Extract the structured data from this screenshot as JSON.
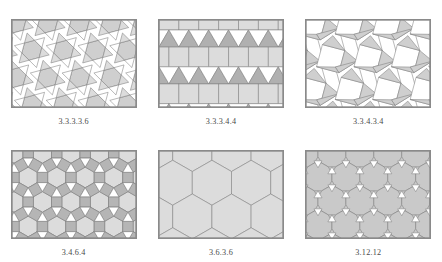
{
  "figure": {
    "kind": "plate-of-tilings",
    "background_color": "#ffffff",
    "panel_border_color": "#8a8a8a",
    "caption_color": "#4a4a4a",
    "colors": {
      "light_gray": "#dcdcdc",
      "mid_gray": "#c9c9c9",
      "dark_gray": "#b0b0b0",
      "white": "#ffffff",
      "stroke": "#7d7d7d"
    },
    "rows": 2,
    "columns": 3
  },
  "panels": [
    {
      "id": "snub-hexagonal",
      "caption": "3.3.3.3.6",
      "tiling": "snub hexagonal",
      "shapes": [
        "triangle",
        "hexagon"
      ],
      "fills": {
        "hexagon": "#cfcfcf",
        "triangle_a": "#dcdcdc",
        "triangle_b": "#ffffff"
      }
    },
    {
      "id": "elongated-triangular",
      "caption": "3.3.3.4.4",
      "tiling": "elongated triangular",
      "shapes": [
        "triangle",
        "square"
      ],
      "fills": {
        "square": "#dcdcdc",
        "triangle_up": "#b0b0b0",
        "triangle_down": "#ffffff"
      }
    },
    {
      "id": "snub-square",
      "caption": "3.3.4.3.4",
      "tiling": "snub square",
      "shapes": [
        "triangle",
        "square"
      ],
      "fills": {
        "square": "#ffffff",
        "triangle": "#cfcfcf"
      }
    },
    {
      "id": "rhombitrihexagonal",
      "caption": "3.4.6.4",
      "tiling": "rhombitrihexagonal",
      "shapes": [
        "triangle",
        "square",
        "hexagon"
      ],
      "fills": {
        "hexagon": "#dcdcdc",
        "square": "#b5b5b5",
        "triangle": "#ffffff"
      }
    },
    {
      "id": "trihexagonal",
      "caption": "3.6.3.6",
      "tiling": "trihexagonal",
      "shapes": [
        "triangle",
        "hexagon"
      ],
      "fills": {
        "hexagon": "#dcdcdc",
        "triangle": "#ffffff"
      }
    },
    {
      "id": "truncated-hexagonal",
      "caption": "3.12.12",
      "tiling": "truncated hexagonal",
      "shapes": [
        "triangle",
        "dodecagon"
      ],
      "fills": {
        "dodecagon": "#c9c9c9",
        "triangle": "#ffffff",
        "ground": "#c9c9c9"
      }
    }
  ]
}
